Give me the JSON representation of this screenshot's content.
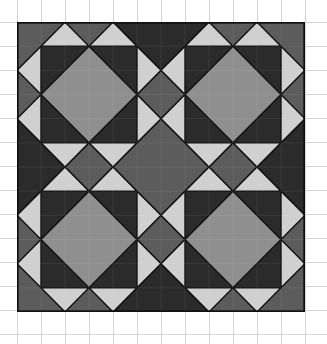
{
  "figure": {
    "title": "",
    "grid_units": 12,
    "cell_px": 24
  },
  "colors": {
    "background": "#5c5c5c",
    "dark": "#2b2b2b",
    "medium": "#8f8f8f",
    "light": "#d0d0d0",
    "outline": "#111111",
    "graph_line": "#d4d4d4"
  },
  "blocks": [
    {
      "name": "top-left",
      "ox": 0,
      "oy": 0
    },
    {
      "name": "top-right",
      "ox": 6,
      "oy": 0
    },
    {
      "name": "bottom-left",
      "ox": 0,
      "oy": 6
    },
    {
      "name": "bottom-right",
      "ox": 6,
      "oy": 6
    }
  ],
  "hourglasses": [
    {
      "name": "top",
      "points": "4,0 8,0 6,2"
    },
    {
      "name": "bottom",
      "points": "4,12 8,12 6,10"
    },
    {
      "name": "left",
      "points": "0,4 0,8 2,6"
    },
    {
      "name": "right",
      "points": "12,4 12,8 10,6"
    }
  ]
}
